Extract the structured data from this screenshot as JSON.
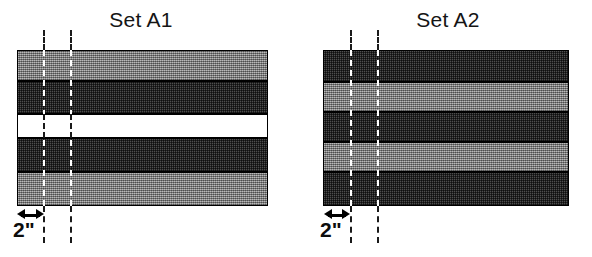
{
  "figure": {
    "background_color": "#ffffff",
    "width": 592,
    "height": 257
  },
  "panels": [
    {
      "id": "set-a1",
      "title": "Set A1",
      "title_left": 78,
      "title_width": 126,
      "specimen": {
        "x": 17,
        "y": 50,
        "width": 251,
        "height": 156
      },
      "bands": [
        {
          "label": "band-light-top",
          "fill": "light",
          "y": 0,
          "height": 31,
          "color": "#8f8f8f"
        },
        {
          "label": "band-dark-upper",
          "fill": "dark",
          "y": 31,
          "height": 33,
          "color": "#3a3a3a"
        },
        {
          "label": "band-void-middle",
          "fill": "void",
          "y": 64,
          "height": 24,
          "color": "#ffffff"
        },
        {
          "label": "band-dark-lower",
          "fill": "dark",
          "y": 88,
          "height": 34,
          "color": "#3a3a3a"
        },
        {
          "label": "band-light-bottom",
          "fill": "light",
          "y": 122,
          "height": 34,
          "color": "#8f8f8f"
        }
      ],
      "dashed_lines": [
        {
          "label": "reference-line-1",
          "x": 43,
          "y": 30,
          "height": 213
        },
        {
          "label": "reference-line-2",
          "x": 70,
          "y": 30,
          "height": 213
        }
      ],
      "dimension": {
        "label": "2\"",
        "arrow_x": 17,
        "arrow_y": 209,
        "arrow_width": 27,
        "label_x": 13,
        "label_y": 219
      }
    },
    {
      "id": "set-a2",
      "title": "Set A2",
      "title_left": 385,
      "title_width": 126,
      "specimen": {
        "x": 323,
        "y": 50,
        "width": 246,
        "height": 156
      },
      "bands": [
        {
          "label": "band-dark-top",
          "fill": "dark",
          "y": 0,
          "height": 32,
          "color": "#3a3a3a"
        },
        {
          "label": "band-light-upper",
          "fill": "light",
          "y": 32,
          "height": 30,
          "color": "#8f8f8f"
        },
        {
          "label": "band-dark-middle",
          "fill": "dark",
          "y": 62,
          "height": 30,
          "color": "#3a3a3a"
        },
        {
          "label": "band-light-lower",
          "fill": "light",
          "y": 92,
          "height": 30,
          "color": "#8f8f8f"
        },
        {
          "label": "band-dark-bottom",
          "fill": "dark",
          "y": 122,
          "height": 34,
          "color": "#3a3a3a"
        }
      ],
      "dashed_lines": [
        {
          "label": "reference-line-1",
          "x": 350,
          "y": 30,
          "height": 213
        },
        {
          "label": "reference-line-2",
          "x": 377,
          "y": 30,
          "height": 213
        }
      ],
      "dimension": {
        "label": "2\"",
        "arrow_x": 324,
        "arrow_y": 209,
        "arrow_width": 26,
        "label_x": 320,
        "label_y": 219
      }
    }
  ]
}
